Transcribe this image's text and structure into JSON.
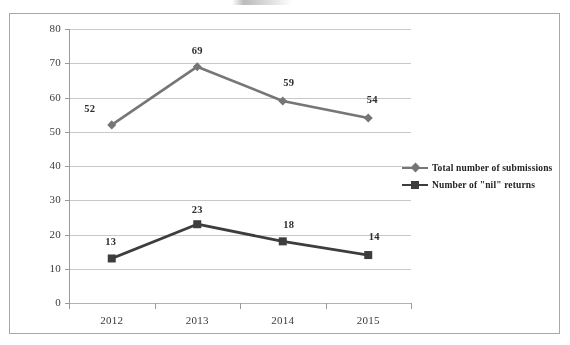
{
  "chart_data": {
    "type": "line",
    "title": "",
    "xlabel": "",
    "ylabel": "",
    "categories": [
      "2012",
      "2013",
      "2014",
      "2015"
    ],
    "ylim": [
      0,
      80
    ],
    "yticks": [
      0,
      10,
      20,
      30,
      40,
      50,
      60,
      70,
      80
    ],
    "ytick_labels": [
      "0",
      "10",
      "20",
      "30",
      "40",
      "50",
      "60",
      "70",
      "80"
    ],
    "grid": true,
    "legend_position": "right",
    "series": [
      {
        "name": "Total number of submissions",
        "marker": "diamond",
        "color": "#767676",
        "values": [
          52,
          69,
          59,
          54
        ],
        "labels": [
          "52",
          "69",
          "59",
          "54"
        ]
      },
      {
        "name": "Number of \"nil\" returns",
        "marker": "square",
        "color": "#3d3d3d",
        "values": [
          13,
          23,
          18,
          14
        ],
        "labels": [
          "13",
          "23",
          "18",
          "14"
        ]
      }
    ]
  },
  "legend": {
    "items": [
      {
        "label": "Total number of submissions",
        "marker": "diamond-marker",
        "color": "#767676"
      },
      {
        "label": "Number of \"nil\" returns",
        "marker": "square-marker",
        "color": "#3d3d3d"
      }
    ]
  },
  "frame": {
    "border_color": "#a8a8a8",
    "grid_color": "#c9c9c9",
    "axis_color": "#9a9a9a",
    "background": "#ffffff"
  }
}
